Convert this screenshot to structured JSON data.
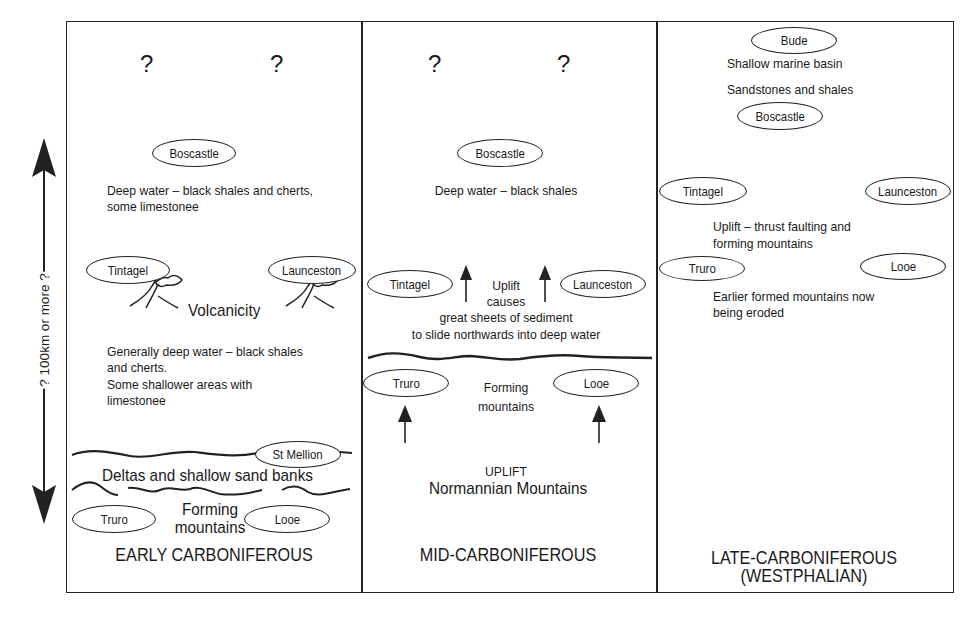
{
  "scale_arrow": {
    "label": "? 100km or more ?"
  },
  "panels": [
    {
      "title": "EARLY CARBONIFEROUS",
      "question_marks": [
        "?",
        "?"
      ],
      "places": {
        "boscastle": "Boscastle",
        "tintagel": "Tintagel",
        "launceston": "Launceston",
        "st_mellion": "St Mellion",
        "truro": "Truro",
        "looe": "Looe"
      },
      "notes": {
        "deep_water_1": "Deep water – black shales and cherts,",
        "deep_water_2": "some limestonee",
        "volcanicity": "Volcanicity",
        "general_1": "Generally deep water – black shales",
        "general_2": "and cherts.",
        "general_3": "Some shallower areas with",
        "general_4": "limestonee",
        "deltas": "Deltas and shallow sand banks",
        "forming_1": "Forming",
        "forming_2": "mountains"
      }
    },
    {
      "title": "MID-CARBONIFEROUS",
      "question_marks": [
        "?",
        "?"
      ],
      "places": {
        "boscastle": "Boscastle",
        "tintagel": "Tintagel",
        "launceston": "Launceston",
        "truro": "Truro",
        "looe": "Looe"
      },
      "notes": {
        "deep_water": "Deep water – black shales",
        "uplift_1": "Uplift",
        "uplift_2": "causes",
        "uplift_3": "great sheets of sediment",
        "uplift_4": "to slide northwards into deep water",
        "forming_1": "Forming",
        "forming_2": "mountains",
        "uplift_caps": "UPLIFT",
        "normannian": "Normannian Mountains"
      }
    },
    {
      "title": "LATE-CARBONIFEROUS",
      "subtitle": "(WESTPHALIAN)",
      "places": {
        "bude": "Bude",
        "boscastle": "Boscastle",
        "tintagel": "Tintagel",
        "launceston": "Launceston",
        "truro": "Truro",
        "looe": "Looe"
      },
      "notes": {
        "shallow": "Shallow marine basin",
        "sandstones": "Sandstones and shales",
        "thrust_1": "Uplift – thrust faulting and",
        "thrust_2": "forming mountains",
        "eroded_1": "Earlier formed mountains now",
        "eroded_2": "being eroded"
      }
    }
  ]
}
